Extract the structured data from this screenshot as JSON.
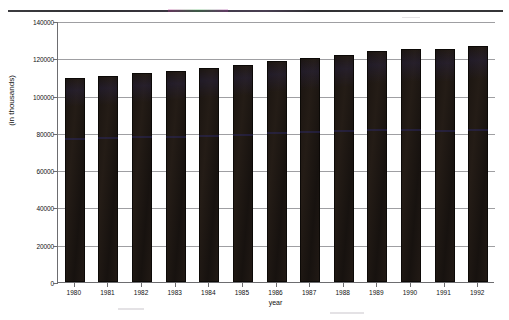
{
  "chart_data": {
    "type": "bar",
    "title": "",
    "xlabel": "year",
    "ylabel": "(in thousands)",
    "categories": [
      "1980",
      "1981",
      "1982",
      "1983",
      "1984",
      "1985",
      "1986",
      "1987",
      "1988",
      "1989",
      "1990",
      "1991",
      "1992"
    ],
    "values": [
      109200,
      110400,
      112000,
      113200,
      114800,
      116400,
      118800,
      120400,
      122000,
      124000,
      124800,
      125200,
      126400
    ],
    "ylim": [
      0,
      140000
    ],
    "ytick_labels": [
      "0",
      "20000",
      "40000",
      "60000",
      "80000",
      "100000",
      "120000",
      "140000"
    ],
    "ytick_values": [
      0,
      20000,
      40000,
      60000,
      80000,
      100000,
      120000,
      140000
    ],
    "grid": true,
    "legend": "none",
    "series_color": "#1a1410",
    "axis_color": "#6d6d70",
    "grid_color": "#8e8e92",
    "background": "#ffffff"
  },
  "artifacts": {
    "scan_line_label": "scan-line-artifact"
  }
}
